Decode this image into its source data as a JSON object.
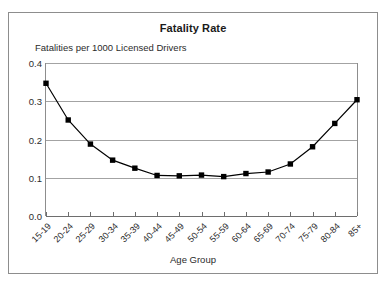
{
  "chart_data": {
    "type": "line",
    "title": "Fatality Rate",
    "subtitle": "Fatalities per 1000 Licensed Drivers",
    "xlabel": "Age Group",
    "ylabel": "",
    "categories": [
      "15-19",
      "20-24",
      "25-29",
      "30-34",
      "35-39",
      "40-44",
      "45-49",
      "50-54",
      "55-59",
      "60-64",
      "65-69",
      "70-74",
      "75-79",
      "80-84",
      "85+"
    ],
    "values": [
      0.347,
      0.251,
      0.188,
      0.146,
      0.125,
      0.106,
      0.105,
      0.107,
      0.103,
      0.111,
      0.115,
      0.136,
      0.181,
      0.242,
      0.304
    ],
    "series": [
      {
        "name": "Fatalities per 1000 Licensed Drivers",
        "values": [
          0.347,
          0.251,
          0.188,
          0.146,
          0.125,
          0.106,
          0.105,
          0.107,
          0.103,
          0.111,
          0.115,
          0.136,
          0.181,
          0.242,
          0.304
        ]
      }
    ],
    "ylim": [
      0.0,
      0.4
    ],
    "yticks": [
      0.0,
      0.1,
      0.2,
      0.3,
      0.4
    ],
    "ytick_labels": [
      "0.0",
      "0.1",
      "0.2",
      "0.3",
      "0.4"
    ],
    "grid": true,
    "legend": false,
    "legend_position": "none",
    "marker": "square",
    "line_color": "#000000",
    "marker_color": "#000000",
    "grid_color": "#a3a3a3",
    "axis_color": "#6e6e6e",
    "frame_color": "#8d8d8d",
    "background": "#ffffff",
    "xtick_label_rotation": -45
  }
}
